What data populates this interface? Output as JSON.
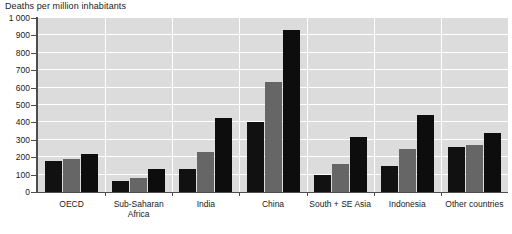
{
  "chart_data": {
    "type": "bar",
    "title": "Deaths per million inhabitants",
    "xlabel": "",
    "ylabel": "Deaths per million inhabitants",
    "ylim": [
      0,
      1000
    ],
    "ytick_labels": [
      "0",
      "100",
      "200",
      "300",
      "400",
      "500",
      "600",
      "700",
      "800",
      "900",
      "1 000"
    ],
    "ytick_values": [
      0,
      100,
      200,
      300,
      400,
      500,
      600,
      700,
      800,
      900,
      1000
    ],
    "grid": "horizontal-white-on-grey",
    "legend": "none",
    "categories": [
      "OECD",
      "Sub-Saharan\nAfrica",
      "India",
      "China",
      "South + SE Asia",
      "Indonesia",
      "Other countries"
    ],
    "series": [
      {
        "name": "series-1",
        "color": "#111111",
        "values": [
          180,
          65,
          135,
          405,
          95,
          150,
          260
        ]
      },
      {
        "name": "series-2",
        "color": "#666666",
        "values": [
          190,
          82,
          228,
          635,
          160,
          250,
          268
        ]
      },
      {
        "name": "series-3",
        "color": "#0d0d0d",
        "values": [
          220,
          130,
          428,
          930,
          315,
          440,
          340
        ]
      }
    ]
  },
  "style": {
    "plot_background": "#dcdcdc",
    "gridline_color": "#ffffff",
    "axis_color": "#4d4d4d",
    "text_color": "#1a1a1a",
    "page_background": "#ffffff"
  }
}
